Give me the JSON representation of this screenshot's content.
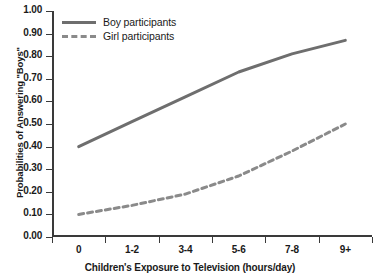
{
  "chart_data": {
    "type": "line",
    "title": "",
    "xlabel": "Children's Exposure to Television (hours/day)",
    "ylabel": "Probabilities of Answering \"Boys\"",
    "categories": [
      "0",
      "1-2",
      "3-4",
      "5-6",
      "7-8",
      "9+"
    ],
    "ylim": [
      0.0,
      1.0
    ],
    "ytick_labels": [
      "1.00",
      "0.90",
      "0.80",
      "0.70",
      "0.60",
      "0.50",
      "0.40",
      "0.30",
      "0.20",
      "0.10",
      "0.00"
    ],
    "ytick_values": [
      1.0,
      0.9,
      0.8,
      0.7,
      0.6,
      0.5,
      0.4,
      0.3,
      0.2,
      0.1,
      0.0
    ],
    "grid": false,
    "legend_position": "top-left",
    "series": [
      {
        "name": "Boy participants",
        "style": "solid",
        "color": "#6e6e6e",
        "values": [
          0.4,
          0.51,
          0.62,
          0.73,
          0.81,
          0.87
        ]
      },
      {
        "name": "Girl participants",
        "style": "dashed",
        "color": "#8a8a8a",
        "values": [
          0.1,
          0.14,
          0.19,
          0.27,
          0.38,
          0.5
        ]
      }
    ]
  },
  "legend": {
    "items": [
      {
        "label": "Boy participants"
      },
      {
        "label": "Girl participants"
      }
    ]
  },
  "axes": {
    "x_title": "Children's Exposure to Television (hours/day)",
    "y_title": "Probabilities of Answering \"Boys\""
  }
}
